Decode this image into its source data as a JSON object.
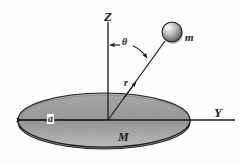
{
  "figure": {
    "background_color": "#fdfdfd",
    "ink_color": "#1a1a1a"
  },
  "axes": {
    "vertical": {
      "label": "Z",
      "name": "z-axis",
      "x": 108,
      "y_top": 22,
      "y_bottom": 120
    },
    "horizontal": {
      "label": "Y",
      "name": "y-axis",
      "y": 120,
      "x_left": 18,
      "x_right": 235
    },
    "origin": {
      "x": 108,
      "y": 120
    }
  },
  "disk": {
    "label": "M",
    "name": "disk-mass-label",
    "center_x": 104,
    "center_y": 120,
    "radius_x": 86,
    "radius_y": 27,
    "thickness": 12,
    "top_fill": "#9a9a9a",
    "rim_fill": "#b4b4b4",
    "edge_color": "#2a2a2a"
  },
  "radius_marker": {
    "label": "a",
    "name": "disk-radius-a",
    "y": 120,
    "x_start": 20,
    "x_end": 106
  },
  "particle": {
    "label": "m",
    "name": "point-mass-m",
    "center_x": 172,
    "center_y": 32,
    "radius": 10,
    "fill": "#8e8e8e",
    "highlight": "#e8e8e8"
  },
  "radial_line": {
    "label": "r",
    "name": "radial-distance-r",
    "x1": 108,
    "y1": 120,
    "x2": 165,
    "y2": 41
  },
  "angle_marker": {
    "label": "θ",
    "name": "polar-angle-theta",
    "y": 45,
    "x_start": 110,
    "x_end": 145
  }
}
